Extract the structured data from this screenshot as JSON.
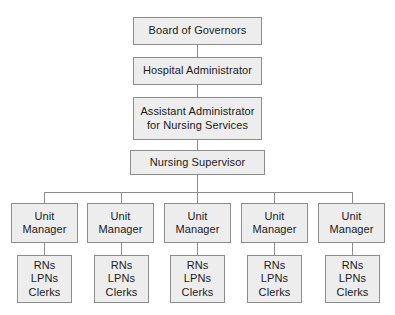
{
  "diagram": {
    "type": "organizational-chart",
    "colors": {
      "box_fill": "#ededed",
      "box_border": "#8c8c8c",
      "line": "#8c8c8c",
      "text": "#1a1a1a",
      "background": "#ffffff"
    },
    "levels": [
      {
        "level": 1,
        "nodes": [
          {
            "id": "board",
            "label": "Board of Governors"
          }
        ]
      },
      {
        "level": 2,
        "nodes": [
          {
            "id": "hospital-administrator",
            "label": "Hospital Administrator"
          }
        ]
      },
      {
        "level": 3,
        "nodes": [
          {
            "id": "assistant-administrator",
            "label": "Assistant Administrator\nfor Nursing Services"
          }
        ]
      },
      {
        "level": 4,
        "nodes": [
          {
            "id": "nursing-supervisor",
            "label": "Nursing Supervisor"
          }
        ]
      },
      {
        "level": 5,
        "nodes": [
          {
            "id": "unit-manager-1",
            "label": "Unit\nManager"
          },
          {
            "id": "unit-manager-2",
            "label": "Unit\nManager"
          },
          {
            "id": "unit-manager-3",
            "label": "Unit\nManager"
          },
          {
            "id": "unit-manager-4",
            "label": "Unit\nManager"
          },
          {
            "id": "unit-manager-5",
            "label": "Unit\nManager"
          }
        ]
      },
      {
        "level": 6,
        "nodes": [
          {
            "id": "staff-1",
            "label": "RNs\nLPNs\nClerks"
          },
          {
            "id": "staff-2",
            "label": "RNs\nLPNs\nClerks"
          },
          {
            "id": "staff-3",
            "label": "RNs\nLPNs\nClerks"
          },
          {
            "id": "staff-4",
            "label": "RNs\nLPNs\nClerks"
          },
          {
            "id": "staff-5",
            "label": "RNs\nLPNs\nClerks"
          }
        ]
      }
    ],
    "edges": [
      {
        "from": "board",
        "to": "hospital-administrator"
      },
      {
        "from": "hospital-administrator",
        "to": "assistant-administrator"
      },
      {
        "from": "assistant-administrator",
        "to": "nursing-supervisor"
      },
      {
        "from": "nursing-supervisor",
        "to": "unit-manager-1"
      },
      {
        "from": "nursing-supervisor",
        "to": "unit-manager-2"
      },
      {
        "from": "nursing-supervisor",
        "to": "unit-manager-3"
      },
      {
        "from": "nursing-supervisor",
        "to": "unit-manager-4"
      },
      {
        "from": "nursing-supervisor",
        "to": "unit-manager-5"
      },
      {
        "from": "unit-manager-1",
        "to": "staff-1"
      },
      {
        "from": "unit-manager-2",
        "to": "staff-2"
      },
      {
        "from": "unit-manager-3",
        "to": "staff-3"
      },
      {
        "from": "unit-manager-4",
        "to": "staff-4"
      },
      {
        "from": "unit-manager-5",
        "to": "staff-5"
      }
    ]
  }
}
